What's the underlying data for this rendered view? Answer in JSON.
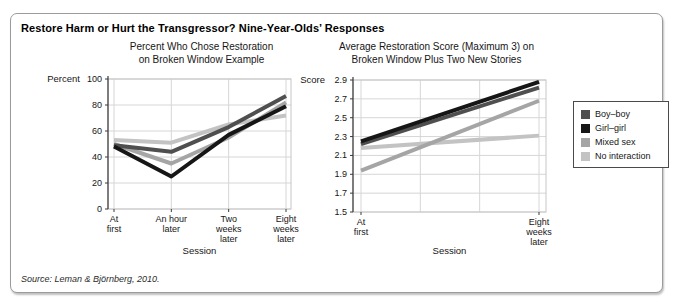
{
  "panel": {
    "title": "Restore Harm or Hurt the Transgressor? Nine-Year-Olds’ Responses",
    "source": "Source: Leman & Björnberg, 2010."
  },
  "legend": {
    "items": [
      {
        "label": "Boy–boy",
        "color": "#4f4f4f"
      },
      {
        "label": "Girl–girl",
        "color": "#161616"
      },
      {
        "label": "Mixed sex",
        "color": "#a5a5a5"
      },
      {
        "label": "No interaction",
        "color": "#c3c3c3"
      }
    ]
  },
  "chart_data": [
    {
      "type": "line",
      "title_lines": [
        "Percent Who Chose Restoration",
        "on Broken Window Example"
      ],
      "axis_label": "Percent",
      "xlabel": "Session",
      "categories": [
        [
          "At",
          "first"
        ],
        [
          "An hour",
          "later"
        ],
        [
          "Two",
          "weeks",
          "later"
        ],
        [
          "Eight",
          "weeks",
          "later"
        ]
      ],
      "ylim": [
        0,
        100
      ],
      "yticks": [
        0,
        20,
        40,
        60,
        80,
        100
      ],
      "grid": true,
      "legend_position": "outside-right",
      "series": [
        {
          "name": "Boy–boy",
          "color": "#4f4f4f",
          "values": [
            49,
            44,
            63,
            87
          ]
        },
        {
          "name": "Girl–girl",
          "color": "#161616",
          "values": [
            48,
            25,
            57,
            79
          ]
        },
        {
          "name": "Mixed sex",
          "color": "#a5a5a5",
          "values": [
            50,
            35,
            55,
            82
          ]
        },
        {
          "name": "No interaction",
          "color": "#c3c3c3",
          "values": [
            53,
            51,
            65,
            72
          ]
        }
      ]
    },
    {
      "type": "line",
      "title_lines": [
        "Average Restoration Score (Maximum 3) on",
        "Broken Window Plus Two New Stories"
      ],
      "axis_label": "Score",
      "xlabel": "Session",
      "categories": [
        [
          "At",
          "first"
        ],
        [
          "Eight",
          "weeks",
          "later"
        ]
      ],
      "ylim": [
        1.5,
        2.9
      ],
      "yticks": [
        1.5,
        1.7,
        1.9,
        2.1,
        2.3,
        2.5,
        2.7,
        2.9
      ],
      "grid": true,
      "grid_x_count": 4,
      "legend_position": "outside-right",
      "series": [
        {
          "name": "Boy–boy",
          "color": "#4f4f4f",
          "values": [
            2.22,
            2.82
          ]
        },
        {
          "name": "Girl–girl",
          "color": "#161616",
          "values": [
            2.25,
            2.88
          ]
        },
        {
          "name": "Mixed sex",
          "color": "#a5a5a5",
          "values": [
            1.94,
            2.68
          ]
        },
        {
          "name": "No interaction",
          "color": "#c3c3c3",
          "values": [
            2.18,
            2.31
          ]
        }
      ]
    }
  ]
}
